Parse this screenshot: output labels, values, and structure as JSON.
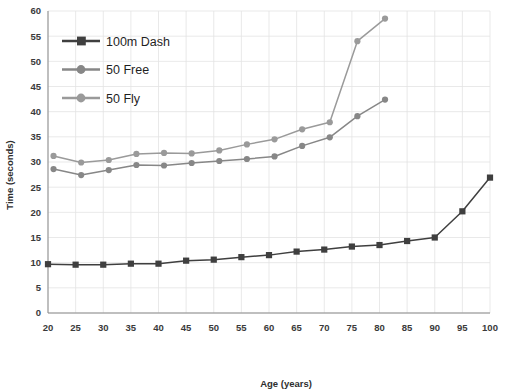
{
  "chart_data": {
    "type": "line",
    "title": "",
    "xlabel": "Age (years)",
    "ylabel": "Time (seconds)",
    "xlim": [
      20,
      100
    ],
    "ylim": [
      0,
      60
    ],
    "xticks": [
      20,
      25,
      30,
      35,
      40,
      45,
      50,
      55,
      60,
      65,
      70,
      75,
      80,
      85,
      90,
      95,
      100
    ],
    "yticks": [
      0,
      5,
      10,
      15,
      20,
      25,
      30,
      35,
      40,
      45,
      50,
      55,
      60
    ],
    "grid": true,
    "legend_position": "upper-left-inside",
    "series": [
      {
        "name": "100m Dash",
        "marker": "square",
        "color": "#3f3f3f",
        "x": [
          20,
          25,
          30,
          35,
          40,
          45,
          50,
          55,
          60,
          65,
          70,
          75,
          80,
          85,
          90,
          95,
          100
        ],
        "values": [
          9.7,
          9.6,
          9.6,
          9.8,
          9.8,
          10.4,
          10.6,
          11.1,
          11.5,
          12.2,
          12.6,
          13.2,
          13.5,
          14.3,
          15.0,
          16.6,
          20.2
        ],
        "x_full": [
          20,
          25,
          30,
          35,
          40,
          45,
          50,
          55,
          60,
          65,
          70,
          75,
          80,
          85,
          90,
          95,
          100
        ],
        "values_full": [
          9.7,
          9.6,
          9.6,
          9.8,
          9.8,
          10.4,
          10.6,
          11.1,
          11.5,
          12.2,
          12.6,
          13.2,
          13.5,
          14.3,
          15.0,
          20.2,
          26.9
        ]
      },
      {
        "name": "50 Free",
        "marker": "circle",
        "color": "#878787",
        "x": [
          21,
          26,
          31,
          36,
          41,
          46,
          51,
          56,
          61,
          66,
          71,
          76,
          81
        ],
        "values": [
          28.6,
          27.4,
          28.4,
          29.4,
          29.3,
          29.8,
          30.2,
          30.6,
          31.1,
          33.2,
          34.9,
          39.1,
          42.4
        ]
      },
      {
        "name": "50 Fly",
        "marker": "circle",
        "color": "#9a9a9a",
        "x": [
          21,
          26,
          31,
          36,
          41,
          46,
          51,
          56,
          61,
          66,
          71,
          76,
          81
        ],
        "values": [
          31.2,
          29.9,
          30.4,
          31.6,
          31.8,
          31.7,
          32.3,
          33.5,
          34.5,
          36.5,
          37.9,
          54.0,
          58.5
        ]
      }
    ]
  },
  "axes": {
    "x_title": "Age (years)",
    "y_title": "Time (seconds)",
    "x_tick_labels": [
      "20",
      "25",
      "30",
      "35",
      "40",
      "45",
      "50",
      "55",
      "60",
      "65",
      "70",
      "75",
      "80",
      "85",
      "90",
      "95",
      "100"
    ],
    "y_tick_labels": [
      "0",
      "5",
      "10",
      "15",
      "20",
      "25",
      "30",
      "35",
      "40",
      "45",
      "50",
      "55",
      "60"
    ]
  },
  "legend": {
    "items": [
      {
        "label": "100m Dash",
        "color": "#3f3f3f",
        "marker": "square"
      },
      {
        "label": "50 Free",
        "color": "#878787",
        "marker": "circle"
      },
      {
        "label": "50 Fly",
        "color": "#9a9a9a",
        "marker": "circle"
      }
    ]
  },
  "colors": {
    "background": "#ffffff",
    "grid": "#e3e3e3",
    "axis": "#8a8a8a",
    "text": "#3a3a3a"
  }
}
